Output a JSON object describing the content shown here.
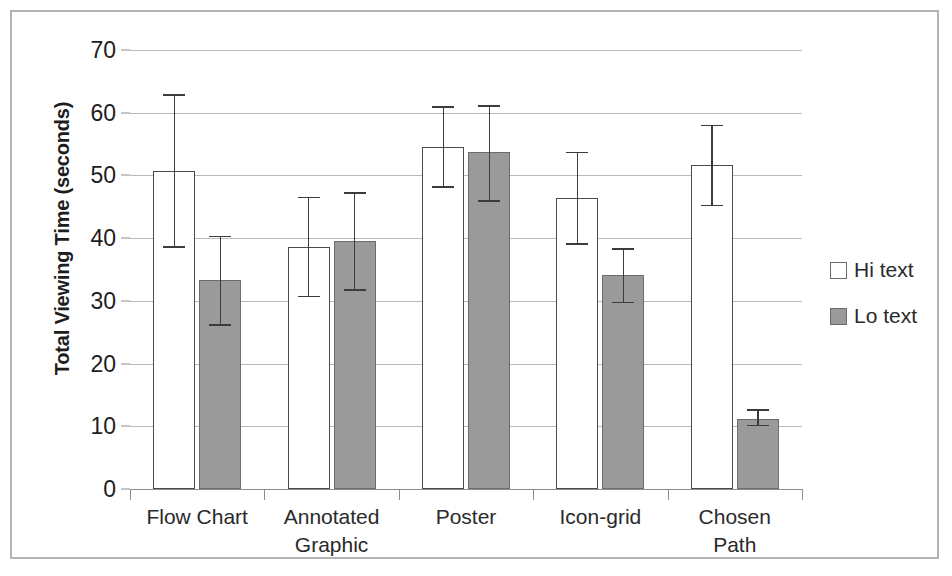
{
  "chart_data": {
    "type": "bar",
    "title": "",
    "xlabel": "",
    "ylabel": "Total Viewing Time (seconds)",
    "ylim": [
      0,
      70
    ],
    "ytick_step": 10,
    "yticks": [
      "0",
      "10",
      "20",
      "30",
      "40",
      "50",
      "60",
      "70"
    ],
    "grid": true,
    "legend_position": "right",
    "categories": [
      "Flow Chart",
      "Annotated\nGraphic",
      "Poster",
      "Icon-grid",
      "Chosen\nPath"
    ],
    "series": [
      {
        "name": "Hi text",
        "color": "#ffffff",
        "edge_color": "#4b4b4b",
        "values": [
          50.7,
          38.6,
          54.5,
          46.4,
          51.6
        ],
        "err_low": [
          38.5,
          30.6,
          48.0,
          38.9,
          45.1
        ],
        "err_high": [
          63.0,
          46.6,
          61.0,
          53.8,
          58.1
        ]
      },
      {
        "name": "Lo text",
        "color": "#9a9a9a",
        "edge_color": "#6d6d6d",
        "values": [
          33.3,
          39.5,
          53.8,
          34.1,
          11.2
        ],
        "err_low": [
          26.0,
          31.6,
          45.8,
          29.6,
          10.0
        ],
        "err_high": [
          40.4,
          47.3,
          61.2,
          38.4,
          12.7
        ]
      }
    ]
  },
  "legend": {
    "items": [
      {
        "label": "Hi text",
        "swatch": "open-square"
      },
      {
        "label": "Lo text",
        "swatch": "filled-square"
      }
    ]
  },
  "axis": {
    "y_title": "Total Viewing Time (seconds)"
  }
}
